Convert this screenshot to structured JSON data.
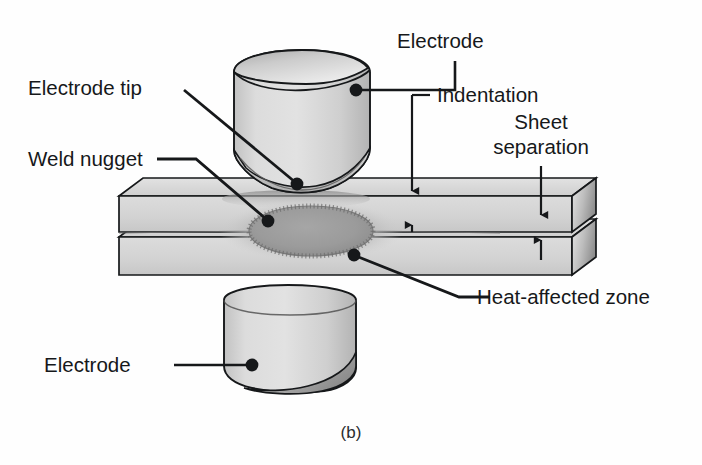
{
  "figure": {
    "caption": "(b)",
    "background_color": "#fefefe",
    "line_color": "#16181a",
    "sheet_color": "#d6d6d6",
    "electrode_color": "#d2d2d2",
    "nugget_color": "#9a9a9a",
    "haz_color": "#b4b4b4"
  },
  "labels": {
    "electrode_top": "Electrode",
    "electrode_tip": "Electrode tip",
    "weld_nugget": "Weld nugget",
    "indentation": "Indentation",
    "sheet_separation_line1": "Sheet",
    "sheet_separation_line2": "separation",
    "heat_affected_zone": "Heat-affected zone",
    "electrode_bottom": "Electrode"
  },
  "parts": [
    {
      "name": "upper-electrode",
      "label": "Electrode",
      "shape": "cylinder-tapered-tip"
    },
    {
      "name": "lower-electrode",
      "label": "Electrode",
      "shape": "cylinder-tapered-tip"
    },
    {
      "name": "upper-sheet",
      "label": "Sheet",
      "shape": "plate"
    },
    {
      "name": "lower-sheet",
      "label": "Sheet",
      "shape": "plate"
    },
    {
      "name": "weld-nugget",
      "label": "Weld nugget",
      "shape": "ellipse"
    },
    {
      "name": "heat-affected-zone",
      "label": "Heat-affected zone",
      "shape": "ellipse-halo"
    },
    {
      "name": "indentation",
      "label": "Indentation",
      "shape": "dimension-arrows"
    },
    {
      "name": "sheet-separation",
      "label": "Sheet separation",
      "shape": "dimension-arrows"
    }
  ]
}
